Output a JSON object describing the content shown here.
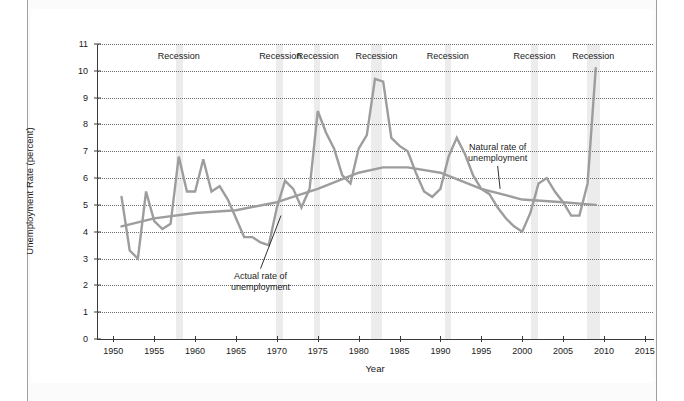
{
  "chart_data": {
    "type": "line",
    "title": "",
    "xlabel": "Year",
    "ylabel": "Unemployment Rate (percent)",
    "xlim": [
      1948,
      2016
    ],
    "ylim": [
      0,
      11
    ],
    "grid": true,
    "legend_position": "none",
    "x_ticks": [
      1950,
      1955,
      1960,
      1965,
      1970,
      1975,
      1980,
      1985,
      1990,
      1995,
      2000,
      2005,
      2010,
      2015
    ],
    "y_ticks": [
      0,
      1,
      2,
      3,
      4,
      5,
      6,
      7,
      8,
      9,
      10,
      11
    ],
    "series": [
      {
        "name": "Actual rate of unemployment",
        "color": "#9d9d9d",
        "x": [
          1951,
          1952,
          1953,
          1954,
          1955,
          1956,
          1957,
          1958,
          1959,
          1960,
          1961,
          1962,
          1963,
          1964,
          1965,
          1966,
          1967,
          1968,
          1969,
          1970,
          1971,
          1972,
          1973,
          1974,
          1975,
          1976,
          1977,
          1978,
          1979,
          1980,
          1981,
          1982,
          1983,
          1984,
          1985,
          1986,
          1987,
          1988,
          1989,
          1990,
          1991,
          1992,
          1993,
          1994,
          1995,
          1996,
          1997,
          1998,
          1999,
          2000,
          2001,
          2002,
          2003,
          2004,
          2005,
          2006,
          2007,
          2008,
          2009
        ],
        "values": [
          5.3,
          3.3,
          3.0,
          5.5,
          4.4,
          4.1,
          4.3,
          6.8,
          5.5,
          5.5,
          6.7,
          5.5,
          5.7,
          5.2,
          4.5,
          3.8,
          3.8,
          3.6,
          3.5,
          4.9,
          5.9,
          5.6,
          4.9,
          5.6,
          8.5,
          7.7,
          7.1,
          6.1,
          5.8,
          7.1,
          7.6,
          9.7,
          9.6,
          7.5,
          7.2,
          7.0,
          6.2,
          5.5,
          5.3,
          5.6,
          6.8,
          7.5,
          6.9,
          6.1,
          5.6,
          5.4,
          4.9,
          4.5,
          4.2,
          4.0,
          4.7,
          5.8,
          6.0,
          5.5,
          5.1,
          4.6,
          4.6,
          5.8,
          10.1
        ]
      },
      {
        "name": "Natural rate of unemployment",
        "color": "#9d9d9d",
        "x": [
          1951,
          1955,
          1960,
          1965,
          1970,
          1975,
          1980,
          1983,
          1986,
          1990,
          1995,
          2000,
          2005,
          2009
        ],
        "values": [
          4.2,
          4.5,
          4.7,
          4.8,
          5.1,
          5.6,
          6.2,
          6.4,
          6.4,
          6.2,
          5.6,
          5.2,
          5.1,
          5.0
        ]
      }
    ],
    "recession_bands": [
      {
        "label": "Recession",
        "start": 1957.7,
        "end": 1958.5,
        "label_x": 1958.0
      },
      {
        "label": "Recession",
        "start": 1969.9,
        "end": 1970.8,
        "label_x": 1970.4
      },
      {
        "label": "Recession",
        "start": 1974.6,
        "end": 1975.3,
        "label_x": 1975.0
      },
      {
        "label": "Recession",
        "start": 1981.5,
        "end": 1982.9,
        "label_x": 1982.2
      },
      {
        "label": "Recession",
        "start": 1990.5,
        "end": 1991.3,
        "label_x": 1990.9
      },
      {
        "label": "Recession",
        "start": 2001.1,
        "end": 2001.9,
        "label_x": 2001.5
      },
      {
        "label": "Recession",
        "start": 2007.9,
        "end": 2009.5,
        "label_x": 2008.7
      }
    ],
    "annotations": [
      {
        "text_line1": "Actual rate of",
        "text_line2": "unemployment",
        "label_x": 1968.0,
        "label_y": 2.55,
        "point_x": 1970.5,
        "point_y": 4.6
      },
      {
        "text_line1": "Natural rate of",
        "text_line2": "unemployment",
        "label_x": 1997.0,
        "label_y": 7.35,
        "point_x": 1997.3,
        "point_y": 5.6
      }
    ],
    "colors": {
      "actual_line": "#9d9d9d",
      "natural_line": "#9d9d9d",
      "recession_band": "#ececec",
      "gridline": "#6b6b6b",
      "axis": "#3a3a3a",
      "text": "#1a1a1a",
      "page_background": "#fbfbfb",
      "figure_background": "#ffffff"
    }
  }
}
